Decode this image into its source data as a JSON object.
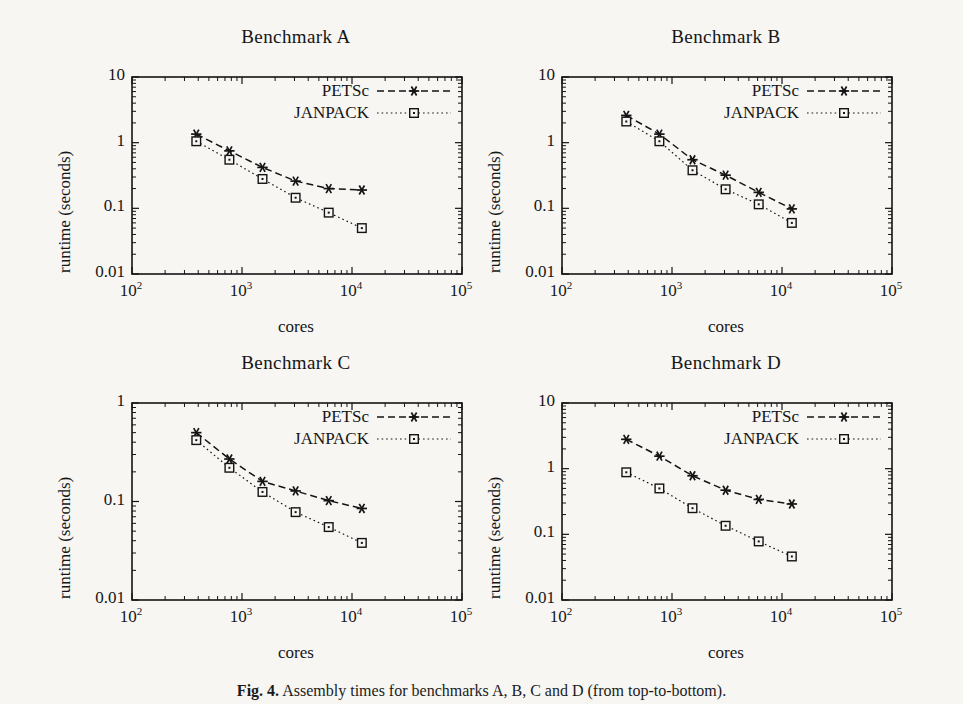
{
  "figure": {
    "caption_label": "Fig. 4.",
    "caption_text": "Assembly times for benchmarks A, B, C and D (from top-to-bottom)."
  },
  "legend": {
    "petsc": "PETSc",
    "janpack": "JANPACK"
  },
  "axes": {
    "xlabel": "cores",
    "ylabel": "runtime (seconds)",
    "xticks": [
      "10",
      "10",
      "10",
      "10"
    ],
    "xtick_exponents": [
      "2",
      "3",
      "4",
      "5"
    ],
    "yticks_3dec": [
      "10",
      "1",
      "0.1",
      "0.01"
    ],
    "yticks_2dec": [
      "1",
      "0.1",
      "0.01"
    ]
  },
  "chart_data": [
    {
      "type": "line",
      "title": "Benchmark A",
      "xlabel": "cores",
      "ylabel": "runtime (seconds)",
      "xscale": "log",
      "yscale": "log",
      "xlim": [
        100,
        100000
      ],
      "ylim": [
        0.01,
        10
      ],
      "grid": false,
      "legend_position": "top-right",
      "x": [
        384,
        768,
        1536,
        3072,
        6144,
        12288
      ],
      "series": [
        {
          "name": "PETSc",
          "marker": "asterisk",
          "linestyle": "dashed",
          "values": [
            1.35,
            0.75,
            0.42,
            0.26,
            0.2,
            0.19
          ]
        },
        {
          "name": "JANPACK",
          "marker": "square",
          "linestyle": "dotted",
          "values": [
            1.05,
            0.55,
            0.28,
            0.145,
            0.086,
            0.05
          ]
        }
      ]
    },
    {
      "type": "line",
      "title": "Benchmark B",
      "xlabel": "cores",
      "ylabel": "runtime (seconds)",
      "xscale": "log",
      "yscale": "log",
      "xlim": [
        100,
        100000
      ],
      "ylim": [
        0.01,
        10
      ],
      "grid": false,
      "legend_position": "top-right",
      "x": [
        384,
        768,
        1536,
        3072,
        6144,
        12288
      ],
      "series": [
        {
          "name": "PETSc",
          "marker": "asterisk",
          "linestyle": "dashed",
          "values": [
            2.6,
            1.35,
            0.55,
            0.32,
            0.175,
            0.098
          ]
        },
        {
          "name": "JANPACK",
          "marker": "square",
          "linestyle": "dotted",
          "values": [
            2.1,
            1.05,
            0.38,
            0.195,
            0.115,
            0.06
          ]
        }
      ]
    },
    {
      "type": "line",
      "title": "Benchmark C",
      "xlabel": "cores",
      "ylabel": "runtime (seconds)",
      "xscale": "log",
      "yscale": "log",
      "xlim": [
        100,
        100000
      ],
      "ylim": [
        0.01,
        1
      ],
      "grid": false,
      "legend_position": "top-right",
      "x": [
        384,
        768,
        1536,
        3072,
        6144,
        12288
      ],
      "series": [
        {
          "name": "PETSc",
          "marker": "asterisk",
          "linestyle": "dashed",
          "values": [
            0.5,
            0.27,
            0.16,
            0.128,
            0.102,
            0.085
          ]
        },
        {
          "name": "JANPACK",
          "marker": "square",
          "linestyle": "dotted",
          "values": [
            0.42,
            0.22,
            0.125,
            0.078,
            0.055,
            0.038
          ]
        }
      ]
    },
    {
      "type": "line",
      "title": "Benchmark D",
      "xlabel": "cores",
      "ylabel": "runtime (seconds)",
      "xscale": "log",
      "yscale": "log",
      "xlim": [
        100,
        100000
      ],
      "ylim": [
        0.01,
        10
      ],
      "grid": false,
      "legend_position": "top-right",
      "x": [
        384,
        768,
        1536,
        3072,
        6144,
        12288
      ],
      "series": [
        {
          "name": "PETSc",
          "marker": "asterisk",
          "linestyle": "dashed",
          "values": [
            2.8,
            1.55,
            0.78,
            0.47,
            0.34,
            0.29
          ]
        },
        {
          "name": "JANPACK",
          "marker": "square",
          "linestyle": "dotted",
          "values": [
            0.88,
            0.5,
            0.25,
            0.135,
            0.078,
            0.046
          ]
        }
      ]
    }
  ]
}
